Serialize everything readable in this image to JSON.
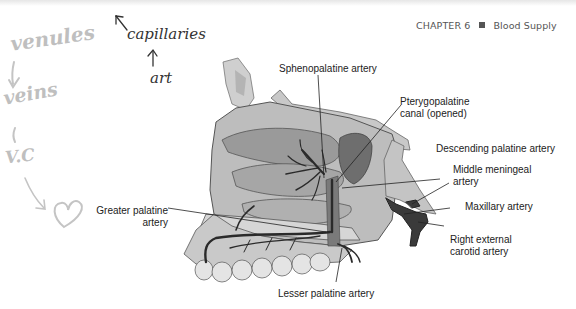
{
  "page": {
    "header": {
      "chapter": "CHAPTER 6",
      "separator_icon": "square-bullet-icon",
      "section": "Blood Supply"
    }
  },
  "handwritten_notes": {
    "venules": "venules",
    "capillaries": "capillaries",
    "art": "art",
    "veins": "veins",
    "vc": "V.C",
    "arrows": [
      "arrow-left-icon",
      "arrow-up-icon",
      "arrow-down-icon",
      "arrow-down-icon",
      "arrow-down-right-icon"
    ],
    "heart_icon": "heart-icon"
  },
  "figure": {
    "labels": {
      "sphenopalatine": "Sphenopalatine artery",
      "pterygopalatine_1": "Pterygopalatine",
      "pterygopalatine_2": "canal (opened)",
      "descending_palatine": "Descending palatine artery",
      "middle_meningeal_1": "Middle meningeal",
      "middle_meningeal_2": "artery",
      "maxillary": "Maxillary artery",
      "external_carotid_1": "Right external",
      "external_carotid_2": "carotid artery",
      "greater_palatine_1": "Greater palatine",
      "greater_palatine_2": "artery",
      "lesser_palatine": "Lesser palatine artery"
    }
  },
  "colors": {
    "text": "#222222",
    "header_text": "#555555",
    "handwriting_dark": "#333333",
    "handwriting_gray": "#bfbfbf",
    "bone_light": "#d9d9d9",
    "bone_mid": "#a8a8a8",
    "artery": "#2a2a2a"
  }
}
